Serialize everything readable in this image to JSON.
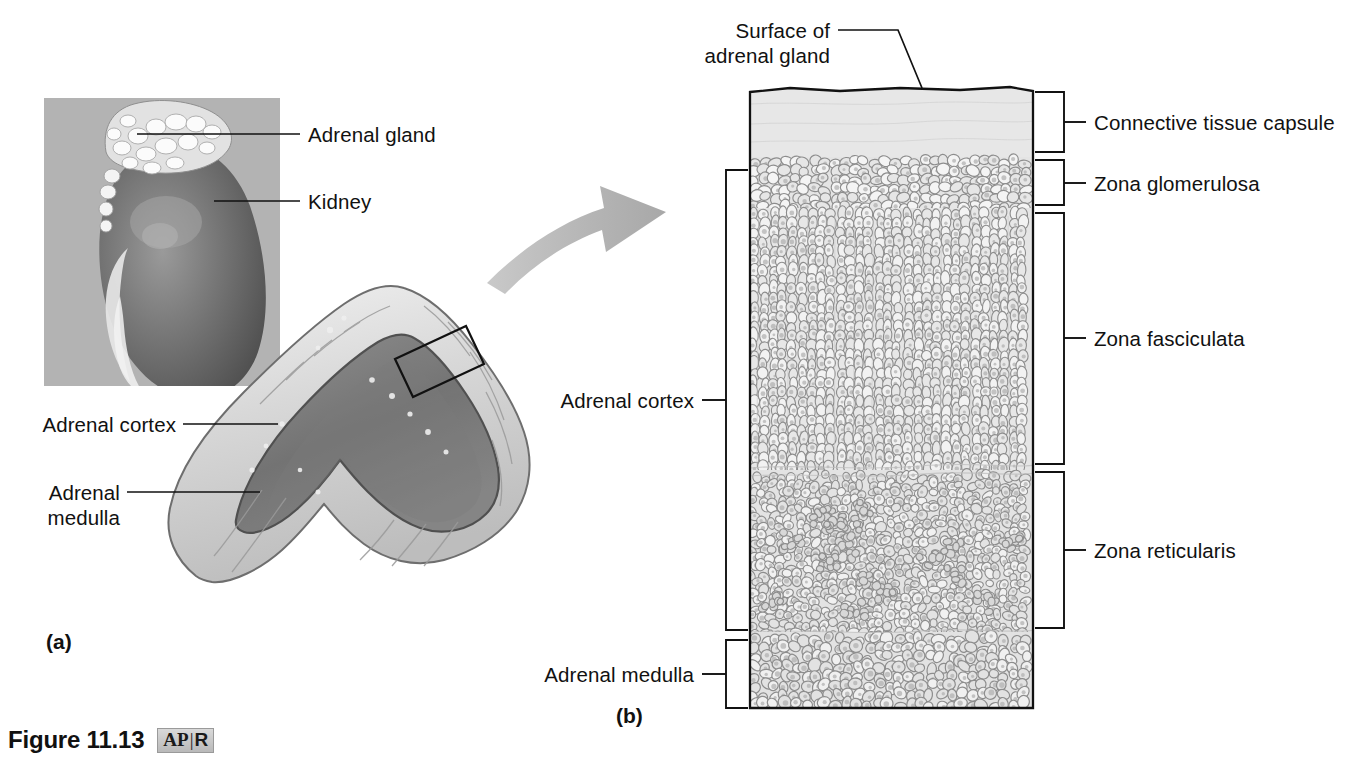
{
  "figure": {
    "number": "Figure 11.13",
    "badge_left": "AP",
    "badge_sep": "|",
    "badge_right": "R"
  },
  "panels": {
    "a": {
      "tag": "(a)"
    },
    "b": {
      "tag": "(b)"
    }
  },
  "panel_a": {
    "title": "Gross anatomy of adrenal gland and kidney",
    "labels": {
      "adrenal_gland": "Adrenal gland",
      "kidney": "Kidney",
      "adrenal_cortex": "Adrenal cortex",
      "adrenal_medulla_line1": "Adrenal",
      "adrenal_medulla_line2": "medulla"
    }
  },
  "panel_b": {
    "title": "Histology of adrenal gland layers",
    "labels": {
      "surface_line1": "Surface of",
      "surface_line2": "adrenal gland",
      "adrenal_cortex": "Adrenal cortex",
      "adrenal_medulla": "Adrenal medulla",
      "connective_tissue_capsule": "Connective tissue capsule",
      "zona_glomerulosa": "Zona glomerulosa",
      "zona_fasciculata": "Zona fasciculata",
      "zona_reticularis": "Zona reticularis"
    },
    "layers": [
      {
        "name": "Connective tissue capsule",
        "top": 88,
        "bottom": 157
      },
      {
        "name": "Zona glomerulosa",
        "top": 157,
        "bottom": 208
      },
      {
        "name": "Zona fasciculata",
        "top": 208,
        "bottom": 470
      },
      {
        "name": "Zona reticularis",
        "top": 470,
        "bottom": 632
      },
      {
        "name": "Adrenal medulla",
        "top": 640,
        "bottom": 708
      }
    ]
  },
  "colors": {
    "ink": "#111111",
    "inset_background": "#b3b3b3",
    "capsule_fill": "#e9e9e9",
    "tissue_fill": "#e4e4e4",
    "cell_outline": "#8d8d8d",
    "arrow_gray": "#b5b5b5",
    "rule": "#1a1a1a"
  },
  "icons": {
    "zoom_arrow": "curved-arrow-icon",
    "callout_box": "magnify-region-icon"
  }
}
